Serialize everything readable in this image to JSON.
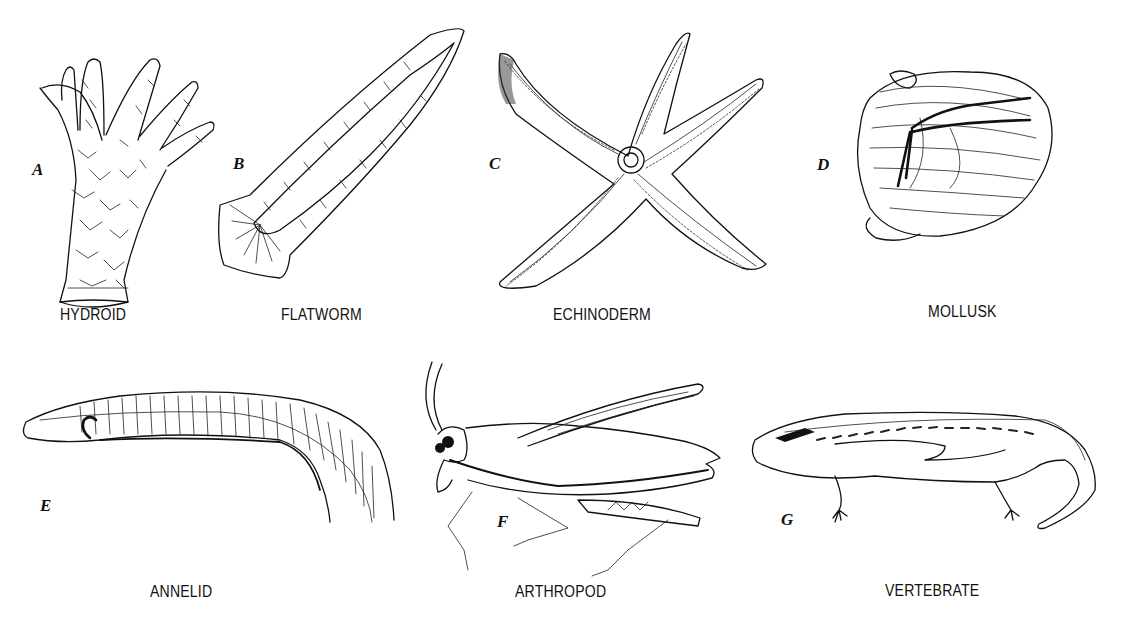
{
  "figure": {
    "panels": [
      {
        "letter": "A",
        "caption": "HYDROID"
      },
      {
        "letter": "B",
        "caption": "FLATWORM"
      },
      {
        "letter": "C",
        "caption": "ECHINODERM"
      },
      {
        "letter": "D",
        "caption": "MOLLUSK"
      },
      {
        "letter": "E",
        "caption": "ANNELID"
      },
      {
        "letter": "F",
        "caption": "ARTHROPOD"
      },
      {
        "letter": "G",
        "caption": "VERTEBRATE"
      }
    ],
    "colors": {
      "background": "#ffffff",
      "ink": "#111111"
    }
  }
}
